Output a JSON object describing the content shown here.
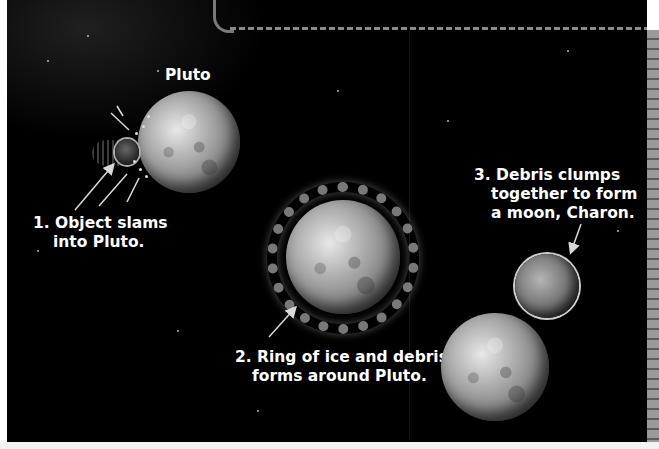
{
  "diagram": {
    "title_label": "Pluto",
    "steps": [
      {
        "number": "1.",
        "lines": [
          "1. Object slams",
          "into Pluto."
        ]
      },
      {
        "number": "2.",
        "lines": [
          "2. Ring of ice and debris",
          "forms around Pluto."
        ]
      },
      {
        "number": "3.",
        "lines": [
          "3. Debris clumps",
          "together to form",
          "a moon, Charon."
        ]
      }
    ],
    "objects": [
      {
        "name": "Pluto (stage 1)",
        "role": "planet"
      },
      {
        "name": "Impacting object",
        "role": "impactor"
      },
      {
        "name": "Pluto with debris ring (stage 2)",
        "role": "planet-with-ring"
      },
      {
        "name": "Pluto (stage 3)",
        "role": "planet"
      },
      {
        "name": "Charon",
        "role": "moon"
      }
    ],
    "colors": {
      "background": "#000000",
      "text": "#ffffff",
      "arrow": "#d9d9d9",
      "dashed_border": "#8a8a8a"
    }
  }
}
